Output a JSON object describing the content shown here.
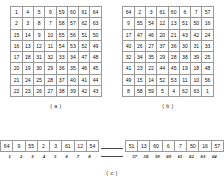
{
  "figure": {
    "grids": [
      {
        "id": "grid-a",
        "caption": "( a )",
        "rows": [
          [
            1,
            4,
            5,
            6,
            59,
            60,
            61,
            64
          ],
          [
            2,
            3,
            8,
            7,
            58,
            57,
            62,
            63
          ],
          [
            15,
            14,
            9,
            10,
            55,
            56,
            51,
            50
          ],
          [
            16,
            13,
            12,
            11,
            54,
            53,
            52,
            49
          ],
          [
            17,
            18,
            31,
            32,
            33,
            34,
            47,
            48
          ],
          [
            20,
            19,
            30,
            29,
            36,
            35,
            46,
            45
          ],
          [
            21,
            24,
            25,
            28,
            37,
            40,
            41,
            44
          ],
          [
            22,
            23,
            26,
            27,
            38,
            39,
            42,
            43
          ]
        ]
      },
      {
        "id": "grid-b",
        "caption": "( b )",
        "rows": [
          [
            64,
            2,
            3,
            61,
            60,
            6,
            7,
            57
          ],
          [
            9,
            55,
            54,
            12,
            13,
            51,
            50,
            16
          ],
          [
            17,
            47,
            46,
            20,
            21,
            43,
            42,
            24
          ],
          [
            40,
            26,
            27,
            37,
            36,
            30,
            31,
            33
          ],
          [
            32,
            34,
            35,
            29,
            28,
            38,
            39,
            25
          ],
          [
            41,
            23,
            22,
            44,
            45,
            19,
            18,
            48
          ],
          [
            49,
            15,
            14,
            52,
            53,
            11,
            10,
            56
          ],
          [
            8,
            58,
            59,
            5,
            4,
            62,
            63,
            1
          ]
        ]
      }
    ],
    "sequence": {
      "caption": "( c )",
      "segments": [
        {
          "id": "segment-left",
          "values": [
            64,
            9,
            55,
            2,
            3,
            61,
            12,
            54
          ],
          "indices": [
            1,
            2,
            3,
            4,
            5,
            6,
            7,
            8
          ]
        },
        {
          "id": "segment-right",
          "values": [
            51,
            13,
            60,
            6,
            7,
            50,
            16,
            57
          ],
          "indices": [
            57,
            58,
            59,
            60,
            61,
            62,
            63,
            64
          ]
        }
      ]
    }
  }
}
